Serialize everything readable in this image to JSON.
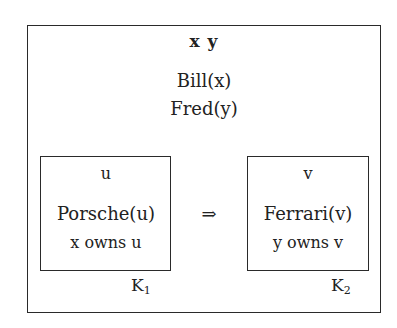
{
  "diagram": {
    "type": "DRS box diagram",
    "outer_box": {
      "referents": "x  y",
      "conditions": [
        "Bill(x)",
        "Fred(y)"
      ]
    },
    "implication_symbol": "⇒",
    "left_box": {
      "referent": "u",
      "conditions": [
        "Porsche(u)",
        "x owns u"
      ],
      "label_main": "K",
      "label_sub": "1"
    },
    "right_box": {
      "referent": "v",
      "conditions": [
        "Ferrari(v)",
        "y owns v"
      ],
      "label_main": "K",
      "label_sub": "2"
    }
  }
}
